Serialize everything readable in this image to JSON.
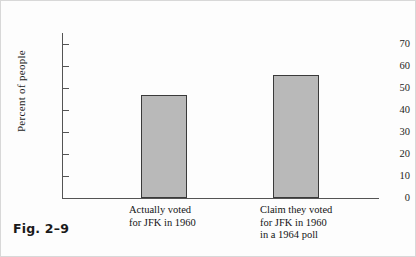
{
  "figure": {
    "caption": "Fig. 2–9",
    "panel_border_color": "#d8d8d8",
    "background_color": "#fdfdfd"
  },
  "chart_data": {
    "type": "bar",
    "title": "",
    "subtitle": "",
    "xlabel": "",
    "ylabel": "Percent of people",
    "ylim": [
      0,
      75
    ],
    "yticks": [
      0,
      10,
      20,
      30,
      40,
      50,
      60,
      70
    ],
    "ytick_labels": [
      "0",
      "10",
      "20",
      "30",
      "40",
      "50",
      "60",
      "70"
    ],
    "grid": false,
    "legend": null,
    "categories": [
      "Actually voted for JFK in 1960",
      "Claim they voted for JFK in 1960 in a 1964 poll"
    ],
    "category_label_lines": [
      [
        "Actually voted",
        "for JFK in 1960"
      ],
      [
        "Claim they voted",
        "for JFK in 1960",
        "in a 1964 poll"
      ]
    ],
    "values": [
      47,
      56
    ],
    "bar_fill_color": "#b9b9b9",
    "bar_edge_color": "#3a3a3a",
    "axis_color": "#545454"
  }
}
